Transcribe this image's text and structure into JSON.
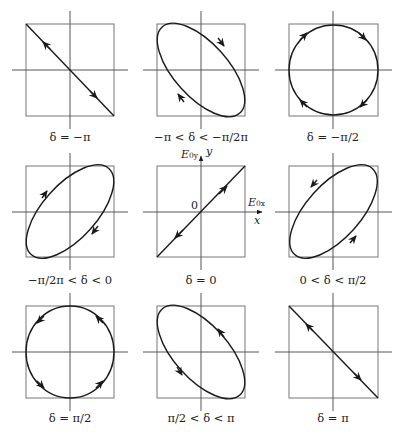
{
  "figure": {
    "panels": [
      {
        "label": "δ = −π",
        "shape": "line",
        "direction": "neg-diag"
      },
      {
        "label": "−π < δ < −π/2π",
        "shape": "ellipse",
        "tilt": "neg",
        "sense": "clockwise"
      },
      {
        "label": "δ = −π/2",
        "shape": "circle",
        "sense": "clockwise"
      },
      {
        "label": "−π/2π < δ < 0",
        "shape": "ellipse",
        "tilt": "pos",
        "sense": "clockwise"
      },
      {
        "label": "δ = 0",
        "shape": "line",
        "direction": "pos-diag"
      },
      {
        "label": "0 < δ < π/2",
        "shape": "ellipse",
        "tilt": "pos",
        "sense": "counterclockwise"
      },
      {
        "label": "δ = π/2",
        "shape": "circle",
        "sense": "counterclockwise"
      },
      {
        "label": "π/2 < δ < π",
        "shape": "ellipse",
        "tilt": "neg",
        "sense": "counterclockwise"
      },
      {
        "label": "δ = π",
        "shape": "line",
        "direction": "neg-diag"
      }
    ],
    "center_axes": {
      "y_amplitude": "E",
      "y_amplitude_sub": "0y",
      "y_axis": "y",
      "x_amplitude": "E",
      "x_amplitude_sub": "0x",
      "x_axis": "x",
      "origin": "0"
    },
    "colors": {
      "box": "#777777",
      "axis": "#555555",
      "curve": "#1a1a1a"
    }
  }
}
